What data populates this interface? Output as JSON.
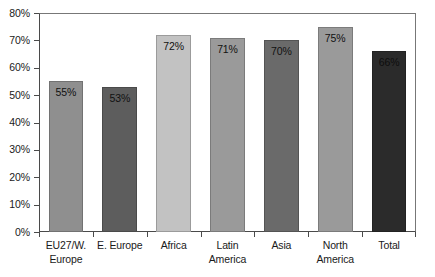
{
  "chart_data": {
    "type": "bar",
    "title": "",
    "subtitle": "",
    "xlabel": "",
    "ylabel": "",
    "ylim": [
      0,
      80
    ],
    "ytick_labels": [
      "80%",
      "70%",
      "60%",
      "50%",
      "40%",
      "30%",
      "20%",
      "10%",
      "0%"
    ],
    "ytick_values": [
      80,
      70,
      60,
      50,
      40,
      30,
      20,
      10,
      0
    ],
    "grid": false,
    "legend": "none",
    "categories": [
      "EU27/W. Europe",
      "E. Europe",
      "Africa",
      "Latin America",
      "Asia",
      "North America",
      "Total"
    ],
    "category_lines": [
      [
        "EU27/W.",
        "Europe"
      ],
      [
        "E. Europe",
        ""
      ],
      [
        "Africa",
        ""
      ],
      [
        "Latin",
        "America"
      ],
      [
        "Asia",
        ""
      ],
      [
        "North",
        "America"
      ],
      [
        "Total",
        ""
      ]
    ],
    "values": [
      55,
      53,
      72,
      71,
      70,
      75,
      66
    ],
    "data_labels": [
      "55%",
      "53%",
      "72%",
      "71%",
      "70%",
      "75%",
      "66%"
    ],
    "bar_colors": [
      "#8f8f8f",
      "#5d5d5d",
      "#c2c2c2",
      "#9a9a9a",
      "#6a6a6a",
      "#9a9a9a",
      "#2b2b2b"
    ],
    "label_text_colors": [
      "#111111",
      "#111111",
      "#111111",
      "#111111",
      "#111111",
      "#111111",
      "#0d0d0d"
    ]
  },
  "axes": {
    "axis_line_color": "#4a4a4a",
    "frame_color": "#777777",
    "background": "#ffffff"
  }
}
